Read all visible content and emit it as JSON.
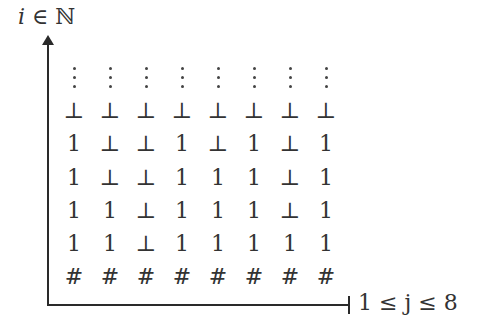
{
  "axes": {
    "y_label": "i ∈ ℕ",
    "y_label_parts": {
      "var": "i",
      "rel": " ∈ ",
      "set": "ℕ"
    },
    "x_label": "1 ≤ j ≤ 8"
  },
  "grid": {
    "columns": 8,
    "top_row": "vertical-ellipsis",
    "rows": [
      [
        "⊥",
        "⊥",
        "⊥",
        "⊥",
        "⊥",
        "⊥",
        "⊥",
        "⊥"
      ],
      [
        "1",
        "⊥",
        "⊥",
        "1",
        "⊥",
        "1",
        "⊥",
        "1"
      ],
      [
        "1",
        "⊥",
        "⊥",
        "1",
        "1",
        "1",
        "⊥",
        "1"
      ],
      [
        "1",
        "1",
        "⊥",
        "1",
        "1",
        "1",
        "⊥",
        "1"
      ],
      [
        "1",
        "1",
        "⊥",
        "1",
        "1",
        "1",
        "1",
        "1"
      ],
      [
        "#",
        "#",
        "#",
        "#",
        "#",
        "#",
        "#",
        "#"
      ]
    ]
  }
}
